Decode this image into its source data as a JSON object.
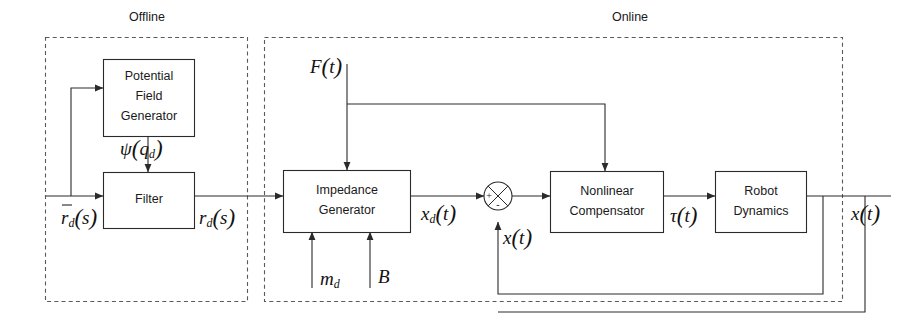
{
  "diagram": {
    "title_semantic": "impedance-control-block-diagram",
    "regions": [
      {
        "id": "offline",
        "label": "Offline"
      },
      {
        "id": "online",
        "label": "Online"
      }
    ],
    "blocks": [
      {
        "id": "potential-field-generator",
        "lines": [
          "Potential",
          "Field",
          "Generator"
        ]
      },
      {
        "id": "filter",
        "lines": [
          "Filter"
        ]
      },
      {
        "id": "impedance-generator",
        "lines": [
          "Impedance",
          "Generator"
        ]
      },
      {
        "id": "nonlinear-compensator",
        "lines": [
          "Nonlinear",
          "Compensator"
        ]
      },
      {
        "id": "robot-dynamics",
        "lines": [
          "Robot",
          "Dynamics"
        ]
      }
    ],
    "summing_junction": {
      "id": "summing-junction",
      "plus_sign": "+",
      "minus_sign": "-"
    },
    "signals": [
      {
        "id": "input-rd-bar",
        "base": "r",
        "sub": "d",
        "arg": "s",
        "overbar": true
      },
      {
        "id": "psi-qd",
        "base": "ψ",
        "sub": "",
        "arg": "q",
        "arg_sub": "d",
        "overbar": false
      },
      {
        "id": "filter-out-rd",
        "base": "r",
        "sub": "d",
        "arg": "s",
        "overbar": false
      },
      {
        "id": "force-ft",
        "base": "F",
        "sub": "",
        "arg": "t",
        "overbar": false
      },
      {
        "id": "xd-t",
        "base": "x",
        "sub": "d",
        "arg": "t",
        "overbar": false
      },
      {
        "id": "x-t-feedback",
        "base": "x",
        "sub": "",
        "arg": "t",
        "overbar": false
      },
      {
        "id": "tau-t",
        "base": "τ",
        "sub": "",
        "arg": "t",
        "overbar": false
      },
      {
        "id": "x-t-output",
        "base": "x",
        "sub": "",
        "arg": "t",
        "overbar": false
      }
    ],
    "parameters": [
      {
        "id": "mass-md",
        "base": "m",
        "sub": "d"
      },
      {
        "id": "damping-b",
        "base": "B",
        "sub": ""
      }
    ],
    "colors": {
      "line": "#2a2a2a",
      "region_border": "#5a5a5a",
      "text": "#1a1a1a",
      "background": "#ffffff"
    }
  }
}
